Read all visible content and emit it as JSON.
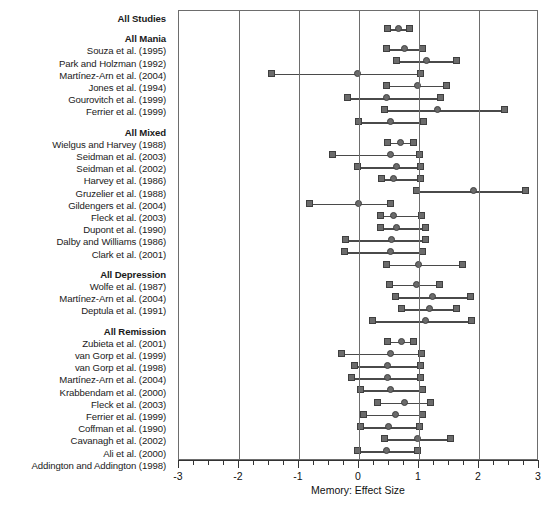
{
  "chart_data": {
    "type": "forest",
    "title": "",
    "xlabel": "Memory: Effect Size",
    "ylabel": "",
    "xlim": [
      -3,
      3
    ],
    "grid": true,
    "gridlines_at": [
      -3,
      -2,
      -1,
      0,
      1,
      2,
      3
    ],
    "major_ticks": [
      -3,
      -2,
      -1,
      0,
      1,
      2,
      3
    ],
    "tick_labels": [
      "-3",
      "-2",
      "-1",
      "0",
      "1",
      "2",
      "3"
    ],
    "minor_tick_step": 0.25,
    "legend": [],
    "marker_shapes": {
      "ci_endpoints": "square",
      "point_estimate": "circle"
    },
    "rows": [
      {
        "label": "All Studies",
        "group": true,
        "low": 0.48,
        "est": 0.66,
        "high": 0.84
      },
      {
        "label": "All Mania",
        "group": true,
        "spacer_before": true,
        "low": 0.45,
        "est": 0.75,
        "high": 1.05
      },
      {
        "label": "Souza et al. (1995)",
        "group": false,
        "low": 0.62,
        "est": 1.12,
        "high": 1.62
      },
      {
        "label": "Park and Holzman (1992)",
        "group": false,
        "low": -1.46,
        "est": -0.02,
        "high": 1.02
      },
      {
        "label": "Martínez-Arn et al. (2004)",
        "group": false,
        "low": 0.46,
        "est": 0.98,
        "high": 1.46
      },
      {
        "label": "Jones et al. (1994)",
        "group": false,
        "low": -0.2,
        "est": 0.46,
        "high": 1.36
      },
      {
        "label": "Gourovitch et al. (1999)",
        "group": false,
        "low": 0.42,
        "est": 1.3,
        "high": 2.42
      },
      {
        "label": "Ferrier et al. (1999)",
        "group": false,
        "low": -0.01,
        "est": 0.52,
        "high": 1.07
      },
      {
        "label": "All Mixed",
        "group": true,
        "spacer_before": true,
        "low": 0.47,
        "est": 0.69,
        "high": 0.91
      },
      {
        "label": "Wielgus and Harvey (1988)",
        "group": false,
        "low": -0.45,
        "est": 0.52,
        "high": 1.0
      },
      {
        "label": "Seidman et al. (2003)",
        "group": false,
        "low": -0.02,
        "est": 0.63,
        "high": 1.02
      },
      {
        "label": "Seidman et al. (2002)",
        "group": false,
        "low": 0.38,
        "est": 0.57,
        "high": 1.03
      },
      {
        "label": "Harvey et al. (1986)",
        "group": false,
        "low": 0.95,
        "est": 1.9,
        "high": 2.78
      },
      {
        "label": "Gruzelier et al. (1988)",
        "group": false,
        "low": -0.82,
        "est": -0.01,
        "high": 0.53
      },
      {
        "label": "Gildengers et al. (2004)",
        "group": false,
        "low": 0.35,
        "est": 0.57,
        "high": 1.04
      },
      {
        "label": "Fleck et al. (2003)",
        "group": false,
        "low": 0.36,
        "est": 0.62,
        "high": 1.1
      },
      {
        "label": "Dupont et al. (1990)",
        "group": false,
        "low": -0.23,
        "est": 0.54,
        "high": 1.1
      },
      {
        "label": "Dalby and Williams (1986)",
        "group": false,
        "low": -0.25,
        "est": 0.52,
        "high": 1.05
      },
      {
        "label": "Clark et al. (2001)",
        "group": false,
        "low": 0.45,
        "est": 0.99,
        "high": 1.73
      },
      {
        "label": "All Depression",
        "group": true,
        "spacer_before": true,
        "low": 0.5,
        "est": 0.95,
        "high": 1.34
      },
      {
        "label": "Wolfe et al. (1987)",
        "group": false,
        "low": 0.6,
        "est": 1.22,
        "high": 1.86
      },
      {
        "label": "Martínez-Arn et al. (2004)",
        "group": false,
        "low": 0.7,
        "est": 1.18,
        "high": 1.63
      },
      {
        "label": "Deptula et al. (1991)",
        "group": false,
        "low": 0.22,
        "est": 1.1,
        "high": 1.88
      },
      {
        "label": "All Remission",
        "group": true,
        "spacer_before": true,
        "low": 0.48,
        "est": 0.7,
        "high": 0.9
      },
      {
        "label": "Zubieta et al. (2001)",
        "group": false,
        "low": -0.29,
        "est": 0.52,
        "high": 1.04
      },
      {
        "label": "van Gorp et al. (1999)",
        "group": false,
        "low": -0.07,
        "est": 0.48,
        "high": 1.02
      },
      {
        "label": "van Gorp et al. (1998)",
        "group": false,
        "low": -0.12,
        "est": 0.48,
        "high": 1.02
      },
      {
        "label": "Martínez-Arn et al. (2004)",
        "group": false,
        "low": 0.02,
        "est": 0.52,
        "high": 1.05
      },
      {
        "label": "Krabbendam et al. (2000)",
        "group": false,
        "low": 0.31,
        "est": 0.76,
        "high": 1.19
      },
      {
        "label": "Fleck et al. (2003)",
        "group": false,
        "low": 0.08,
        "est": 0.6,
        "high": 1.06
      },
      {
        "label": "Ferrier et al. (1999)",
        "group": false,
        "low": 0.02,
        "est": 0.49,
        "high": 1.0
      },
      {
        "label": "Coffman et al. (1990)",
        "group": false,
        "low": 0.42,
        "est": 0.97,
        "high": 1.52
      },
      {
        "label": "Cavanagh et al. (2002)",
        "group": false,
        "low": -0.02,
        "est": 0.45,
        "high": 0.98
      },
      {
        "label": "Ali et al. (2000)",
        "group": false,
        "low": 0.0,
        "est": 0.52,
        "high": 1.04
      },
      {
        "label": "Addington and Addington (1998)",
        "group": false,
        "low": -0.08,
        "est": 0.33,
        "high": 0.88
      },
      {
        "label": "",
        "group": false,
        "low": 0.56,
        "est": 1.03,
        "high": 1.48
      }
    ]
  }
}
